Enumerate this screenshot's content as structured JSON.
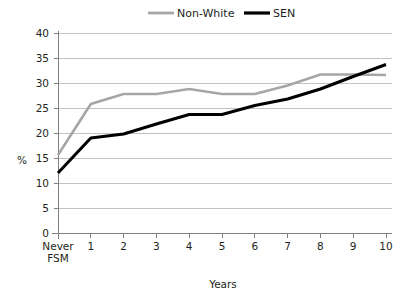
{
  "chart_data": {
    "type": "line",
    "title": "",
    "xlabel": "Years",
    "ylabel": "%",
    "ylim": [
      0,
      40
    ],
    "yticks": [
      0,
      5,
      10,
      15,
      20,
      25,
      30,
      35,
      40
    ],
    "ytick_labels": [
      "0",
      "5",
      "10",
      "15",
      "20",
      "25",
      "30",
      "35",
      "40"
    ],
    "categories": [
      "Never FSM",
      "1",
      "2",
      "3",
      "4",
      "5",
      "6",
      "7",
      "8",
      "9",
      "10"
    ],
    "category_lines": [
      [
        "Never",
        "FSM"
      ],
      [
        "1"
      ],
      [
        "2"
      ],
      [
        "3"
      ],
      [
        "4"
      ],
      [
        "5"
      ],
      [
        "6"
      ],
      [
        "7"
      ],
      [
        "8"
      ],
      [
        "9"
      ],
      [
        "10"
      ]
    ],
    "grid": "horizontal",
    "legend_position": "top",
    "series": [
      {
        "name": "Non-White",
        "color": "#a6a6a6",
        "stroke_width": 2.6,
        "values": [
          15.6,
          25.8,
          27.8,
          27.8,
          28.8,
          27.8,
          27.8,
          29.5,
          31.7,
          31.7,
          31.6
        ]
      },
      {
        "name": "SEN",
        "color": "#000000",
        "stroke_width": 3.0,
        "values": [
          12.0,
          19.0,
          19.8,
          21.8,
          23.7,
          23.7,
          25.5,
          26.8,
          28.8,
          31.3,
          33.7
        ]
      }
    ]
  },
  "legend": {
    "items": [
      {
        "label": "Non-White",
        "color": "#a6a6a6"
      },
      {
        "label": "SEN",
        "color": "#000000"
      }
    ]
  },
  "axes": {
    "y_axis_title": "%",
    "x_axis_title": "Years"
  },
  "colors": {
    "non_white": "#a6a6a6",
    "sen": "#000000",
    "gridline": "#b3b3b3",
    "axis": "#808080",
    "text": "#231f20",
    "background": "#ffffff"
  }
}
